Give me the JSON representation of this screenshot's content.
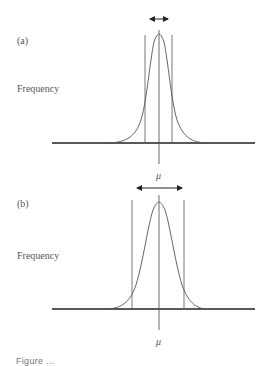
{
  "panels": [
    {
      "id": "a",
      "label": "(a)",
      "ylabel": "Frequency",
      "mean_label": "μ",
      "spread": "narrow"
    },
    {
      "id": "b",
      "label": "(b)",
      "ylabel": "Frequency",
      "mean_label": "μ",
      "spread": "wide"
    }
  ],
  "caption": "Figure ..."
}
